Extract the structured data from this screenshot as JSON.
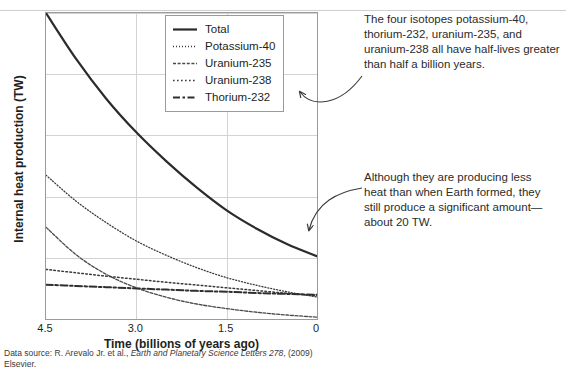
{
  "chart_data": {
    "type": "line",
    "title": "",
    "xlabel": "Time (billions of years ago)",
    "ylabel": "Internal heat production (TW)",
    "xlim": [
      4.5,
      0
    ],
    "ylim": [
      0,
      100
    ],
    "xticks": [
      "4.5",
      "3.0",
      "1.5",
      "0"
    ],
    "xtick_values": [
      4.5,
      3.0,
      1.5,
      0
    ],
    "yticks": [
      "0",
      "20",
      "40",
      "60",
      "80",
      "100"
    ],
    "ytick_values": [
      0,
      20,
      40,
      60,
      80,
      100
    ],
    "grid": "both",
    "legend_position": "top-right-inside",
    "x": [
      4.5,
      4.0,
      3.5,
      3.0,
      2.5,
      2.0,
      1.5,
      1.0,
      0.5,
      0.0
    ],
    "series": [
      {
        "name": "Total",
        "style": "solid",
        "color": "#2b2b2b",
        "width": 2.2,
        "values": [
          100.0,
          85.0,
          72.0,
          61.0,
          51.5,
          43.0,
          35.5,
          29.5,
          24.5,
          20.5
        ]
      },
      {
        "name": "Potassium-40",
        "style": "fine-dotted",
        "color": "#3a3a3a",
        "width": 1.3,
        "values": [
          47.0,
          38.5,
          31.5,
          25.5,
          20.8,
          16.8,
          13.5,
          11.0,
          8.9,
          7.2
        ]
      },
      {
        "name": "Uranium-235",
        "style": "short-dash",
        "color": "#4a4a4a",
        "width": 1.3,
        "values": [
          30.0,
          21.0,
          14.6,
          10.2,
          7.1,
          4.9,
          3.4,
          2.2,
          1.3,
          0.6
        ]
      },
      {
        "name": "Uranium-238",
        "style": "dotted",
        "color": "#3a3a3a",
        "width": 1.5,
        "values": [
          16.2,
          15.1,
          14.0,
          13.0,
          12.0,
          11.1,
          10.2,
          9.3,
          8.4,
          7.6
        ]
      },
      {
        "name": "Thorium-232",
        "style": "dash-dot",
        "color": "#2f2f2f",
        "width": 2.0,
        "values": [
          11.2,
          10.8,
          10.4,
          10.0,
          9.6,
          9.2,
          8.9,
          8.5,
          8.2,
          7.9
        ]
      }
    ]
  },
  "legend": {
    "items": [
      {
        "label": "Total",
        "style": "solid"
      },
      {
        "label": "Potassium-40",
        "style": "fine-dotted"
      },
      {
        "label": "Uranium-235",
        "style": "short-dash"
      },
      {
        "label": "Uranium-238",
        "style": "dotted"
      },
      {
        "label": "Thorium-232",
        "style": "dash-dot"
      }
    ]
  },
  "annotations": [
    {
      "id": "annotation-half-lives",
      "text": "The four isotopes potassium-40, thorium-232, uranium-235, and uranium-238 all have half-lives greater than half a billion years."
    },
    {
      "id": "annotation-current-output",
      "text": "Although they are producing less heat than when Earth formed, they still produce a significant amount—about 20 TW."
    }
  ],
  "source": {
    "prefix": "Data source: R. Arevalo Jr. et al., ",
    "italic": "Earth and Planetary Science Letters 278",
    "suffix": ", (2009) Elsevier."
  },
  "colors": {
    "ink": "#231f20",
    "grid": "#d3d3d3",
    "frame": "#9a9a9a",
    "annotation": "#2b2b2b"
  }
}
